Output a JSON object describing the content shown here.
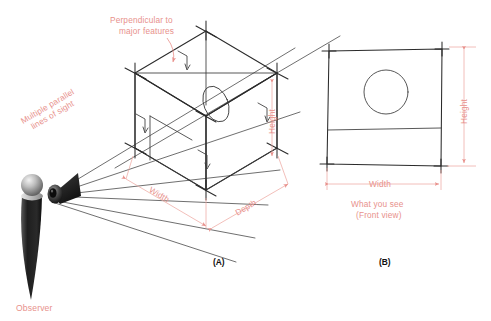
{
  "figure": {
    "title_note": "Orthographic projection illustration",
    "background_color": "#ffffff",
    "line_color": "#2b2b2b",
    "annotation_color": "#e8918c",
    "panel_label_color": "#101010"
  },
  "panel_a": {
    "label": "(A)",
    "annotations": {
      "perpendicular": "Perpendicular to\nmajor features",
      "perpendicular_line1": "Perpendicular to",
      "perpendicular_line2": "major features",
      "lines_of_sight_line1": "Multiple parallel",
      "lines_of_sight_line2": "lines of sight",
      "observer": "Observer"
    },
    "dimensions": {
      "width": "Width",
      "depth": "Depth",
      "height": "Height"
    }
  },
  "panel_b": {
    "label": "(B)",
    "caption_line1": "What you see",
    "caption_line2": "(Front view)",
    "dimensions": {
      "width": "Width",
      "height": "Height"
    }
  }
}
